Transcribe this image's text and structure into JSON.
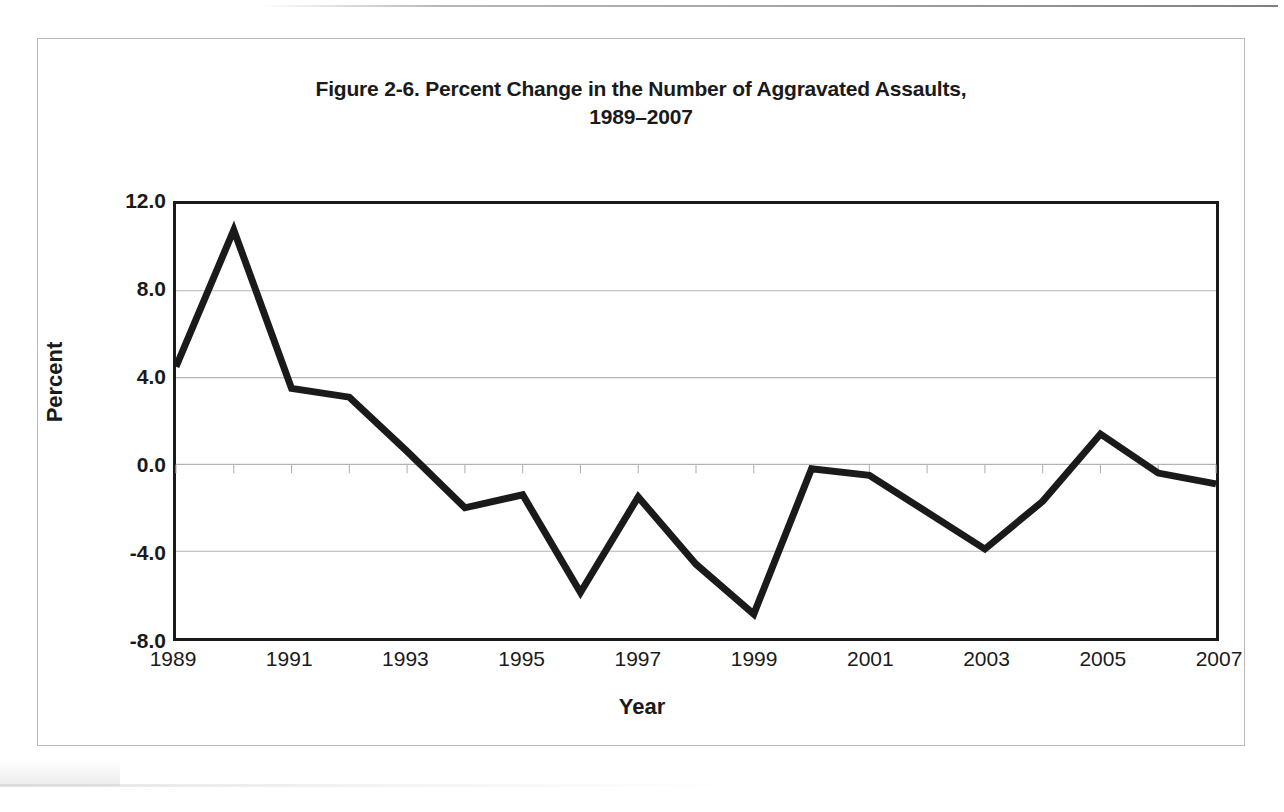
{
  "figure": {
    "title_line1": "Figure 2-6. Percent Change in the Number of Aggravated Assaults,",
    "title_line2": "1989–2007"
  },
  "chart_data": {
    "type": "line",
    "title": "Figure 2-6. Percent Change in the Number of Aggravated Assaults, 1989–2007",
    "xlabel": "Year",
    "ylabel": "Percent",
    "x": [
      1989,
      1990,
      1991,
      1992,
      1993,
      1994,
      1995,
      1996,
      1997,
      1998,
      1999,
      2000,
      2001,
      2002,
      2003,
      2004,
      2005,
      2006,
      2007
    ],
    "values": [
      4.5,
      10.8,
      3.5,
      3.1,
      0.6,
      -2.0,
      -1.4,
      -5.9,
      -1.5,
      -4.6,
      -6.9,
      -0.2,
      -0.5,
      -2.2,
      -3.9,
      -1.7,
      1.4,
      -0.4,
      -0.9
    ],
    "series": [
      {
        "name": "Percent change in aggravated assaults",
        "values": [
          4.5,
          10.8,
          3.5,
          3.1,
          0.6,
          -2.0,
          -1.4,
          -5.9,
          -1.5,
          -4.6,
          -6.9,
          -0.2,
          -0.5,
          -2.2,
          -3.9,
          -1.7,
          1.4,
          -0.4,
          -0.9
        ]
      }
    ],
    "xlim": [
      1989,
      2007
    ],
    "ylim": [
      -8.0,
      12.0
    ],
    "ytick_labels": [
      "12.0",
      "8.0",
      "4.0",
      "0.0",
      "-4.0",
      "-8.0"
    ],
    "ytick_values": [
      12.0,
      8.0,
      4.0,
      0.0,
      -4.0,
      -8.0
    ],
    "xtick_labels": [
      "1989",
      "1991",
      "1993",
      "1995",
      "1997",
      "1999",
      "2001",
      "2003",
      "2005",
      "2007"
    ],
    "xtick_values": [
      1989,
      1991,
      1993,
      1995,
      1997,
      1999,
      2001,
      2003,
      2005,
      2007
    ],
    "grid": "horizontal",
    "legend": "none",
    "line_color": "#1a1a1a",
    "background_color": "#ffffff",
    "plot_border_color": "#1a1a1a",
    "gridline_color": "#b4b4b4"
  }
}
